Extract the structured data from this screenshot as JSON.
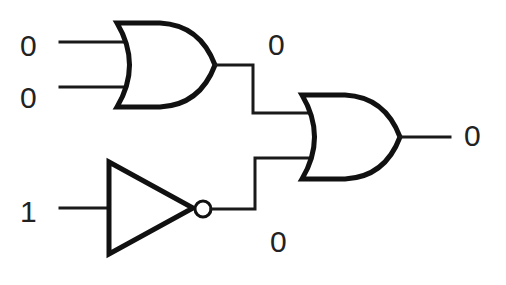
{
  "diagram": {
    "title": "",
    "inputs": [
      {
        "id": "A",
        "label": "0"
      },
      {
        "id": "B",
        "label": "0"
      },
      {
        "id": "C",
        "label": "1"
      }
    ],
    "gates": [
      {
        "id": "or1",
        "type": "OR",
        "inputs": [
          "A",
          "B"
        ],
        "output_label": "0"
      },
      {
        "id": "not1",
        "type": "NOT",
        "inputs": [
          "C"
        ],
        "output_label": "0"
      },
      {
        "id": "or2",
        "type": "OR",
        "inputs": [
          "or1",
          "not1"
        ],
        "output_label": "0"
      }
    ],
    "output": {
      "label": "0"
    },
    "colors": {
      "line": "#111111",
      "background": "#ffffff"
    }
  }
}
